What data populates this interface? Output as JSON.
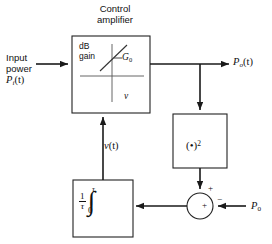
{
  "diagram": {
    "title": "Control amplifier",
    "title_lines": [
      "Control",
      "amplifier"
    ],
    "blocks": {
      "amplifier": {
        "name": "Control amplifier",
        "inner_plot": {
          "y_axis_label_lines": [
            "dB",
            "gain"
          ],
          "y_axis_label": "dB gain",
          "x_axis_label": "v",
          "curve_annotation": "G",
          "curve_annotation_sub": "0",
          "curve_annotation_full": "— G₀",
          "dash_marker": "—"
        }
      },
      "squarer": {
        "name": "squarer",
        "label_open": "(",
        "label_dot": "•",
        "label_close": ")",
        "label_exponent": "2",
        "label_full": "( • )²"
      },
      "integrator": {
        "name": "averaging integrator",
        "fraction_numerator": "1",
        "fraction_denominator": "τ",
        "integral_sign": "∫",
        "upper_limit": "τ",
        "lower_limit": "0",
        "label_full": "(1/τ) ∫₀^τ"
      },
      "summer": {
        "name": "summing junction",
        "center_sign": "+",
        "top_sign": "+",
        "right_sign": "−"
      }
    },
    "signals": {
      "input_lines": [
        "Input",
        "power"
      ],
      "input_line1": "Input",
      "input_line2": "power",
      "input_symbol": "P",
      "input_symbol_sub": "i",
      "input_symbol_arg": "(t)",
      "input_full": "Input power Pᵢ(t)",
      "output_symbol": "P",
      "output_symbol_sub": "o",
      "output_symbol_arg": "(t)",
      "output_full": "Pₒ(t)",
      "control_symbol": "v",
      "control_symbol_arg": "(t)",
      "control_full": "v(t)",
      "reference_symbol": "P",
      "reference_symbol_sub": "0",
      "reference_full": "P₀"
    },
    "colors": {
      "line": "#1a1a1a",
      "text": "#111111",
      "background": "#ffffff",
      "box_stroke": "#222222"
    }
  }
}
